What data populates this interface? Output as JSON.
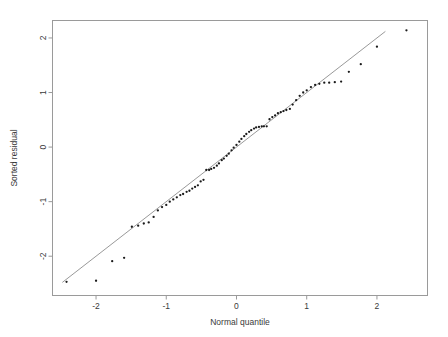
{
  "figure": {
    "name": "normal-qq-plot",
    "background_color": "#ffffff",
    "frame_color": "#9a9a9a",
    "point_color": "#1a1a1a",
    "line_color": "#8d8d8d"
  },
  "chart_data": {
    "type": "scatter",
    "title": "",
    "xlabel": "Normal quantile",
    "ylabel": "Sorted residual",
    "xlim": [
      -2.62,
      2.72
    ],
    "ylim": [
      -2.72,
      2.32
    ],
    "xticks": [
      -2,
      -1,
      0,
      1,
      2
    ],
    "xticklabels": [
      "-2",
      "-1",
      "0",
      "1",
      "2"
    ],
    "yticks": [
      -2,
      -1,
      0,
      1,
      2
    ],
    "yticklabels": [
      "-2",
      "-1",
      "0",
      "1",
      "2"
    ],
    "grid": false,
    "legend": null,
    "reference_line": {
      "name": "qq-reference-line",
      "slope": 1.0,
      "intercept": 0.0,
      "x_start": -2.48,
      "y_start": -2.48,
      "x_end": 2.12,
      "y_end": 2.12
    },
    "series": [
      {
        "name": "sorted-residuals",
        "marker": "point",
        "x": [
          -2.42,
          -2.0,
          -1.77,
          -1.6,
          -1.49,
          -1.4,
          -1.32,
          -1.25,
          -1.18,
          -1.12,
          -1.06,
          -1.0,
          -0.95,
          -0.9,
          -0.85,
          -0.8,
          -0.76,
          -0.71,
          -0.67,
          -0.63,
          -0.59,
          -0.55,
          -0.51,
          -0.47,
          -0.43,
          -0.39,
          -0.36,
          -0.32,
          -0.28,
          -0.25,
          -0.21,
          -0.18,
          -0.14,
          -0.11,
          -0.07,
          -0.04,
          0.0,
          0.04,
          0.07,
          0.11,
          0.14,
          0.18,
          0.21,
          0.25,
          0.28,
          0.32,
          0.36,
          0.39,
          0.43,
          0.47,
          0.51,
          0.55,
          0.59,
          0.63,
          0.67,
          0.71,
          0.76,
          0.8,
          0.85,
          0.9,
          0.95,
          1.0,
          1.06,
          1.12,
          1.18,
          1.25,
          1.32,
          1.4,
          1.49,
          1.6,
          1.77,
          2.0,
          2.42
        ],
        "y": [
          -2.47,
          -2.45,
          -2.09,
          -2.03,
          -1.46,
          -1.44,
          -1.4,
          -1.38,
          -1.28,
          -1.16,
          -1.1,
          -1.06,
          -1.0,
          -0.96,
          -0.92,
          -0.88,
          -0.86,
          -0.82,
          -0.8,
          -0.76,
          -0.73,
          -0.7,
          -0.63,
          -0.6,
          -0.42,
          -0.42,
          -0.4,
          -0.38,
          -0.34,
          -0.3,
          -0.24,
          -0.21,
          -0.16,
          -0.12,
          -0.06,
          -0.01,
          0.04,
          0.1,
          0.15,
          0.2,
          0.24,
          0.28,
          0.31,
          0.34,
          0.36,
          0.37,
          0.38,
          0.38,
          0.38,
          0.51,
          0.55,
          0.58,
          0.62,
          0.64,
          0.66,
          0.68,
          0.7,
          0.78,
          0.86,
          0.94,
          1.0,
          1.04,
          1.1,
          1.14,
          1.16,
          1.18,
          1.18,
          1.19,
          1.2,
          1.38,
          1.52,
          1.84,
          2.14
        ]
      }
    ]
  }
}
